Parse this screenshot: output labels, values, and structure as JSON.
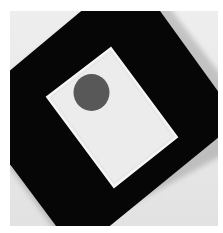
{
  "image": {
    "description": "Photograph of a black square board rotated diagonally with a white rectangular card on it and a dark grey circle near the card's upper-left",
    "colors": {
      "page_background": "#ffffff",
      "photo_background": "#e6e6e6",
      "board": "#060606",
      "card": "#ececec",
      "card_edge": "#f7f7f7",
      "circle": "#585858"
    }
  }
}
